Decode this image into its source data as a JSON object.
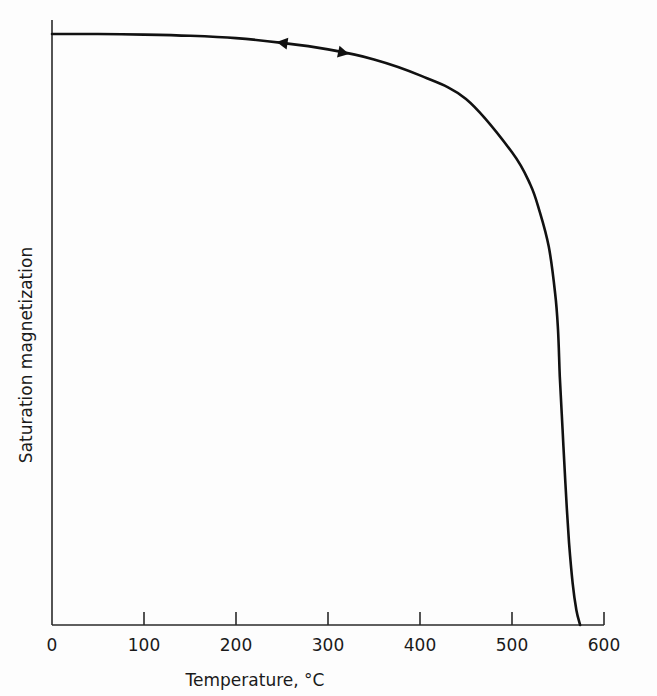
{
  "chart_data": {
    "type": "line",
    "title": "",
    "xlabel": "Temperature, °C",
    "ylabel": "Saturation magnetization",
    "xlim": [
      0,
      600
    ],
    "ylim": [
      0,
      1.0
    ],
    "x_ticks": [
      0,
      100,
      200,
      300,
      400,
      500,
      600
    ],
    "x_tick_labels": [
      "0",
      "100",
      "200",
      "300",
      "400",
      "500",
      "600"
    ],
    "y_ticks": [],
    "grid": false,
    "legend": null,
    "series": [
      {
        "name": "Saturation magnetization (heating/cooling, reversible)",
        "x": [
          0,
          50,
          100,
          150,
          200,
          250,
          300,
          350,
          400,
          450,
          500,
          520,
          530,
          540,
          547,
          550,
          552,
          555,
          558,
          562,
          566,
          570,
          574
        ],
        "values": [
          1.0,
          1.0,
          0.999,
          0.997,
          0.993,
          0.985,
          0.974,
          0.957,
          0.93,
          0.89,
          0.8,
          0.745,
          0.7,
          0.64,
          0.56,
          0.5,
          0.42,
          0.33,
          0.24,
          0.14,
          0.07,
          0.025,
          0.0
        ]
      }
    ],
    "annotations": [
      {
        "type": "arrow",
        "direction": "left",
        "x": 250,
        "note": "cooling direction arrow on curve"
      },
      {
        "type": "arrow",
        "direction": "right",
        "x": 317,
        "note": "heating direction arrow on curve"
      }
    ]
  },
  "labels": {
    "x_axis_title": "Temperature, °C",
    "y_axis_title": "Saturation magnetization",
    "ticks": [
      "0",
      "100",
      "200",
      "300",
      "400",
      "500",
      "600"
    ]
  },
  "colors": {
    "background": "#fdfdfd",
    "line": "#111111",
    "axis": "#2a2a2a"
  }
}
